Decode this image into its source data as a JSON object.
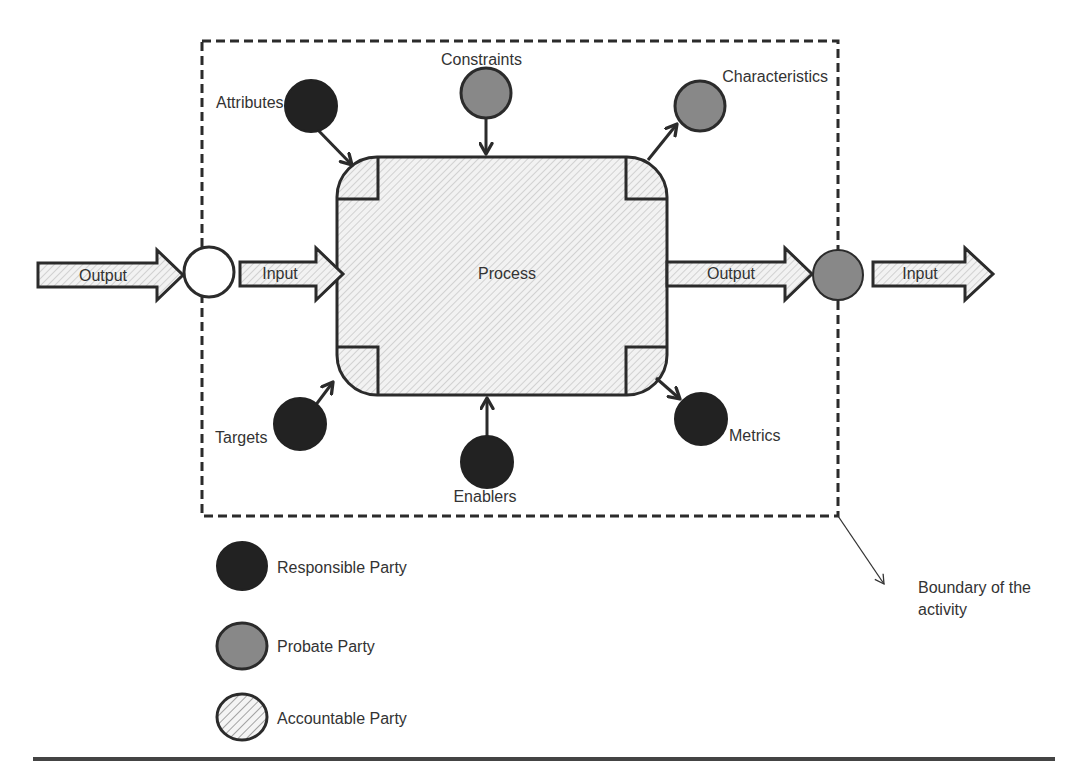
{
  "colors": {
    "responsible": "#222222",
    "probate": "#888888",
    "accountable_bg": "#f2f2f2",
    "accountable_hatch": "#c4c4c4",
    "stroke": "#2b2b2b",
    "text": "#333333"
  },
  "process": {
    "label": "Process"
  },
  "flow": {
    "left_output": "Output",
    "left_input": "Input",
    "right_output": "Output",
    "right_input": "Input"
  },
  "nodes": {
    "attributes": "Attributes",
    "constraints": "Constraints",
    "characteristics": "Characteristics",
    "targets": "Targets",
    "enablers": "Enablers",
    "metrics": "Metrics"
  },
  "boundary": {
    "label_line1": "Boundary of the",
    "label_line2": "activity"
  },
  "legend": [
    {
      "label": "Responsible Party",
      "type": "responsible"
    },
    {
      "label": "Probate Party",
      "type": "probate"
    },
    {
      "label": "Accountable Party",
      "type": "accountable"
    }
  ]
}
